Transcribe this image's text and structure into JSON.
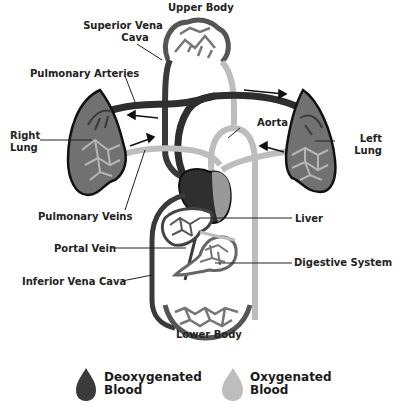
{
  "labels": {
    "upper_body": "Upper Body",
    "superior_vena_cava_1": "Superior Vena",
    "superior_vena_cava_2": "Cava",
    "pulmonary_arteries": "Pulmonary Arteries",
    "right_lung_1": "Right",
    "right_lung_2": "Lung",
    "aorta": "Aorta",
    "left_lung_1": "Left",
    "left_lung_2": "Lung",
    "pulmonary_veins": "Pulmonary Veins",
    "liver": "Liver",
    "portal_vein": "Portal Vein",
    "digestive_system": "Digestive System",
    "inferior_vena_cava": "Inferior Vena Cava",
    "lower_body": "Lower Body"
  },
  "legend": {
    "deoxygenated": {
      "line1": "Deoxygenated",
      "line2": "Blood",
      "color": "#3a3a3a"
    },
    "oxygenated": {
      "line1": "Oxygenated",
      "line2": "Blood",
      "color": "#bdbdbd"
    }
  },
  "colors": {
    "deoxygenated": "#333333",
    "oxygenated": "#b8b8b8",
    "lung_fill": "#707070",
    "outline": "#111111"
  }
}
